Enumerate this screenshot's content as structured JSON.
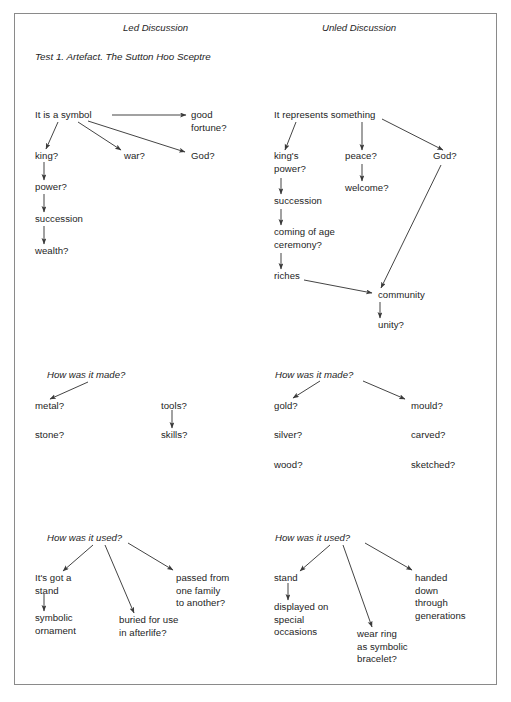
{
  "document": {
    "title": "Test 1. Artefact. The Sutton Hoo Sceptre",
    "columns": [
      {
        "label": "Led Discussion"
      },
      {
        "label": "Unled Discussion"
      }
    ]
  },
  "sections": [
    {
      "id": "section-symbol",
      "led": {
        "nodes": [
          {
            "id": "led-s-root",
            "text": "It is a symbol"
          },
          {
            "id": "led-s-good",
            "text": "good\nfortune?"
          },
          {
            "id": "led-s-king",
            "text": "king?"
          },
          {
            "id": "led-s-war",
            "text": "war?"
          },
          {
            "id": "led-s-god",
            "text": "God?"
          },
          {
            "id": "led-s-power",
            "text": "power?"
          },
          {
            "id": "led-s-succession",
            "text": "succession"
          },
          {
            "id": "led-s-wealth",
            "text": "wealth?"
          }
        ]
      },
      "unled": {
        "nodes": [
          {
            "id": "unl-s-root",
            "text": "It represents something"
          },
          {
            "id": "unl-s-kingspower",
            "text": "king's\npower?"
          },
          {
            "id": "unl-s-peace",
            "text": "peace?"
          },
          {
            "id": "unl-s-god",
            "text": "God?"
          },
          {
            "id": "unl-s-welcome",
            "text": "welcome?"
          },
          {
            "id": "unl-s-succession",
            "text": "succession"
          },
          {
            "id": "unl-s-coming",
            "text": "coming of age\nceremony?"
          },
          {
            "id": "unl-s-riches",
            "text": "riches"
          },
          {
            "id": "unl-s-community",
            "text": "community"
          },
          {
            "id": "unl-s-unity",
            "text": "unity?"
          }
        ]
      }
    },
    {
      "id": "section-made",
      "heading": "How was it made?",
      "led": {
        "nodes": [
          {
            "id": "led-m-metal",
            "text": "metal?"
          },
          {
            "id": "led-m-stone",
            "text": "stone?"
          },
          {
            "id": "led-m-tools",
            "text": "tools?"
          },
          {
            "id": "led-m-skills",
            "text": "skills?"
          }
        ]
      },
      "unled": {
        "nodes": [
          {
            "id": "unl-m-gold",
            "text": "gold?"
          },
          {
            "id": "unl-m-silver",
            "text": "silver?"
          },
          {
            "id": "unl-m-wood",
            "text": "wood?"
          },
          {
            "id": "unl-m-mould",
            "text": "mould?"
          },
          {
            "id": "unl-m-carved",
            "text": "carved?"
          },
          {
            "id": "unl-m-sketched",
            "text": "sketched?"
          }
        ]
      }
    },
    {
      "id": "section-used",
      "heading": "How was it used?",
      "led": {
        "nodes": [
          {
            "id": "led-u-stand",
            "text": "It's got a\nstand"
          },
          {
            "id": "led-u-symbolic",
            "text": "symbolic\nornament"
          },
          {
            "id": "led-u-buried",
            "text": "buried for use\nin afterlife?"
          },
          {
            "id": "led-u-passed",
            "text": "passed from\none family\nto another?"
          }
        ]
      },
      "unled": {
        "nodes": [
          {
            "id": "unl-u-stand",
            "text": "stand"
          },
          {
            "id": "unl-u-displayed",
            "text": "displayed on\nspecial\noccasions"
          },
          {
            "id": "unl-u-wear",
            "text": "wear ring\nas symbolic\nbracelet?"
          },
          {
            "id": "unl-u-handed",
            "text": "handed\ndown\nthrough\ngenerations"
          }
        ]
      }
    }
  ],
  "style": {
    "ink": "#242424",
    "stroke": "#3a3a3a",
    "frame": "#8a8a8a",
    "paper": "#ffffff"
  }
}
